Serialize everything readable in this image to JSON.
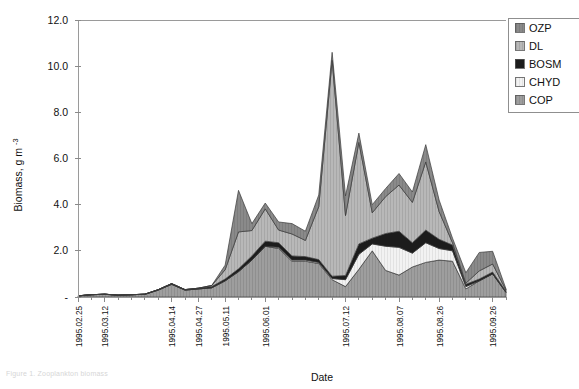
{
  "figure": {
    "caption_fragment": "Figure 1. Zooplankton biomass"
  },
  "chart_data": {
    "type": "area",
    "stacked": true,
    "title": "",
    "xlabel": "Date",
    "ylabel": "Biomass, g m-3",
    "ylabel_display": "Biomass, g m",
    "ylabel_exponent": "-3",
    "ylim": [
      0,
      12
    ],
    "yticks": [
      0,
      2,
      4,
      6,
      8,
      10,
      12
    ],
    "ytick_labels": [
      "-",
      "2.0",
      "4.0",
      "6.0",
      "8.0",
      "10.0",
      "12.0"
    ],
    "grid": false,
    "legend_position": "top-right",
    "legend_order": [
      "OZP",
      "DL",
      "BOSM",
      "CHYD",
      "COP"
    ],
    "colors": {
      "OZP": "#8a8a8a",
      "DL": "#b8b8b8",
      "BOSM": "#1c1c1c",
      "CHYD": "#f2f2f2",
      "COP": "#9e9e9e"
    },
    "x": [
      "1995.02.25",
      "1995.03.04",
      "1995.03.12",
      "1995.03.19",
      "1995.03.26",
      "1995.04.02",
      "1995.04.08",
      "1995.04.14",
      "1995.04.20",
      "1995.04.27",
      "1995.05.04",
      "1995.05.11",
      "1995.05.18",
      "1995.05.24",
      "1995.06.01",
      "1995.06.08",
      "1995.06.14",
      "1995.06.20",
      "1995.06.27",
      "1995.07.04",
      "1995.07.12",
      "1995.07.18",
      "1995.07.24",
      "1995.07.31",
      "1995.08.07",
      "1995.08.13",
      "1995.08.19",
      "1995.08.26",
      "1995.09.02",
      "1995.09.09",
      "1995.09.17",
      "1995.09.26",
      "1995.10.02"
    ],
    "xtick_labels": [
      "1995.02.25",
      "1995.03.12",
      "1995.04.14",
      "1995.04.27",
      "1995.05.11",
      "1995.06.01",
      "1995.07.12",
      "1995.08.07",
      "1995.08.26",
      "1995.09.26"
    ],
    "xtick_indices": [
      0,
      2,
      7,
      9,
      11,
      14,
      20,
      24,
      27,
      31
    ],
    "series": [
      {
        "name": "COP",
        "values": [
          0.05,
          0.1,
          0.12,
          0.08,
          0.1,
          0.12,
          0.3,
          0.55,
          0.3,
          0.35,
          0.4,
          0.7,
          1.1,
          1.6,
          2.2,
          2.1,
          1.55,
          1.55,
          1.45,
          0.75,
          0.45,
          1.2,
          2.0,
          1.15,
          0.95,
          1.3,
          1.5,
          1.6,
          1.55,
          0.35,
          0.7,
          1.0,
          0.2
        ]
      },
      {
        "name": "CHYD",
        "values": [
          0.0,
          0.0,
          0.0,
          0.0,
          0.0,
          0.0,
          0.0,
          0.0,
          0.0,
          0.0,
          0.0,
          0.0,
          0.0,
          0.0,
          0.0,
          0.05,
          0.05,
          0.05,
          0.05,
          0.05,
          0.3,
          0.65,
          0.3,
          1.05,
          1.2,
          0.6,
          0.85,
          0.5,
          0.45,
          0.1,
          0.0,
          0.0,
          0.0
        ]
      },
      {
        "name": "BOSM",
        "values": [
          0.0,
          0.0,
          0.0,
          0.0,
          0.0,
          0.0,
          0.02,
          0.03,
          0.02,
          0.03,
          0.05,
          0.08,
          0.12,
          0.18,
          0.22,
          0.2,
          0.18,
          0.15,
          0.12,
          0.1,
          0.18,
          0.45,
          0.25,
          0.55,
          0.7,
          0.45,
          0.55,
          0.4,
          0.25,
          0.1,
          0.08,
          0.08,
          0.05
        ]
      },
      {
        "name": "DL",
        "values": [
          0.0,
          0.0,
          0.0,
          0.0,
          0.0,
          0.0,
          0.0,
          0.0,
          0.0,
          0.0,
          0.05,
          0.4,
          1.6,
          1.1,
          1.4,
          0.55,
          0.95,
          0.7,
          2.3,
          9.35,
          2.6,
          4.4,
          1.1,
          1.6,
          2.0,
          1.75,
          2.95,
          1.2,
          0.1,
          0.05,
          0.35,
          0.35,
          0.05
        ]
      },
      {
        "name": "OZP",
        "values": [
          0.0,
          0.0,
          0.0,
          0.0,
          0.0,
          0.0,
          0.0,
          0.0,
          0.0,
          0.0,
          0.0,
          0.2,
          1.8,
          0.3,
          0.25,
          0.35,
          0.45,
          0.4,
          0.5,
          0.35,
          0.85,
          0.4,
          0.35,
          0.35,
          0.5,
          0.45,
          0.75,
          0.5,
          0.2,
          0.45,
          0.8,
          0.55,
          0.05
        ]
      }
    ]
  }
}
